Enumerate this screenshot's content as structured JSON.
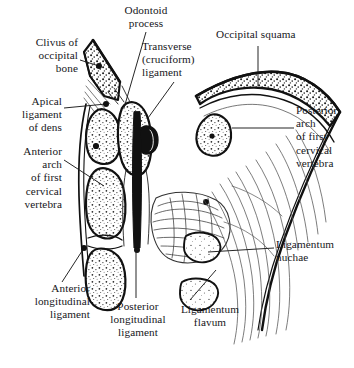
{
  "figure": {
    "background_color": "#ffffff",
    "ink_color": "#16161a",
    "labels": [
      {
        "id": "odontoid-process",
        "text": "Odontoid\nprocess",
        "align": "center",
        "x": 104,
        "y": 4,
        "w": 84
      },
      {
        "id": "clivus-of-occipital-bone",
        "text": "Clivus of\noccipital\nbone",
        "align": "right",
        "x": 0,
        "y": 36,
        "w": 78
      },
      {
        "id": "transverse-ligament",
        "text": "Transverse\n(cruciform)\nligament",
        "align": "left",
        "x": 142,
        "y": 40,
        "w": 90
      },
      {
        "id": "occipital-squama",
        "text": "Occipital squama",
        "align": "left",
        "x": 216,
        "y": 28,
        "w": 116
      },
      {
        "id": "apical-ligament-of-dens",
        "text": "Apical\nligament\nof dens",
        "align": "right",
        "x": 0,
        "y": 95,
        "w": 62
      },
      {
        "id": "posterior-arch",
        "text": "Posterior\narch\nof first\ncervical\nvertebra",
        "align": "left",
        "x": 296,
        "y": 104,
        "w": 58
      },
      {
        "id": "anterior-arch",
        "text": "Anterior\narch\nof first\ncervical\nvertebra",
        "align": "right",
        "x": 0,
        "y": 145,
        "w": 62
      },
      {
        "id": "ligamentum-nuchae",
        "text": "Ligamentum\nnuchae",
        "align": "left",
        "x": 276,
        "y": 238,
        "w": 78
      },
      {
        "id": "anterior-longitudinal-ligament",
        "text": "Anterior\nlongitudinal\nligament",
        "align": "right",
        "x": 10,
        "y": 282,
        "w": 80
      },
      {
        "id": "posterior-longitudinal-ligament",
        "text": "Posterior\nlongitudinal\nligament",
        "align": "center",
        "x": 96,
        "y": 300,
        "w": 84
      },
      {
        "id": "ligamentum-flavum",
        "text": "Ligamentum\nflavum",
        "align": "center",
        "x": 168,
        "y": 303,
        "w": 84
      }
    ],
    "leaders": [
      {
        "id": "leader-clivus",
        "from": [
          80,
          60
        ],
        "to": [
          99,
          66
        ],
        "dot": true
      },
      {
        "id": "leader-odontoid",
        "from": [
          146,
          32
        ],
        "to": [
          124,
          108
        ],
        "dot": false
      },
      {
        "id": "leader-transverse",
        "from": [
          174,
          82
        ],
        "to": [
          148,
          118
        ],
        "dot": false
      },
      {
        "id": "leader-squama",
        "from": [
          258,
          46
        ],
        "to": [
          258,
          86
        ],
        "dot": false
      },
      {
        "id": "leader-apical",
        "from": [
          64,
          108
        ],
        "to": [
          106,
          104
        ],
        "dot": true
      },
      {
        "id": "leader-posterior-arch",
        "from": [
          294,
          128
        ],
        "to": [
          232,
          128
        ],
        "dot": false
      },
      {
        "id": "leader-anterior-arch",
        "from": [
          64,
          160
        ],
        "to": [
          104,
          186
        ],
        "dot": false
      },
      {
        "id": "leader-nuchae",
        "from": [
          274,
          248
        ],
        "to": [
          208,
          252
        ],
        "dot": true
      },
      {
        "id": "leader-ant-long",
        "from": [
          62,
          282
        ],
        "to": [
          84,
          248
        ],
        "dot": true
      },
      {
        "id": "leader-post-long",
        "from": [
          136,
          298
        ],
        "to": [
          136,
          248
        ],
        "dot": false
      },
      {
        "id": "leader-flavum",
        "from": [
          190,
          300
        ],
        "to": [
          216,
          270
        ],
        "dot": false
      }
    ]
  }
}
